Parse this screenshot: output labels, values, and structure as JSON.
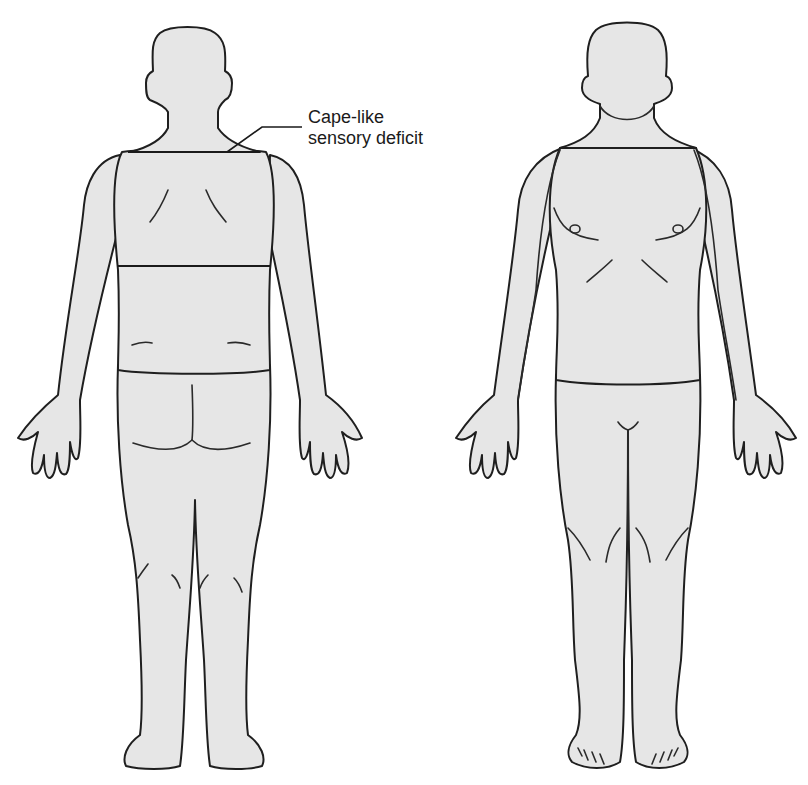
{
  "figure": {
    "views": [
      {
        "id": "posterior",
        "label": "Back view"
      },
      {
        "id": "anterior",
        "label": "Front view"
      }
    ],
    "annotation": {
      "line1": "Cape-like",
      "line2": "sensory deficit"
    },
    "colors": {
      "body_fill": "#e6e6e6",
      "outline": "#1f1f1f",
      "background": "#ffffff"
    }
  }
}
